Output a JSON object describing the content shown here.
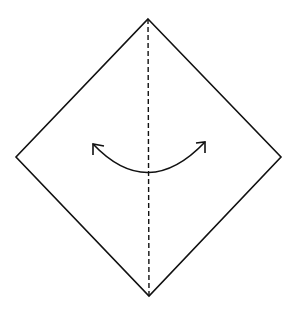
{
  "diagram": {
    "type": "origami-fold-step",
    "colors": {
      "background": "#ffffff",
      "stroke": "#111111"
    },
    "paper": {
      "shape": "diamond",
      "vertices": {
        "top": [
          148,
          19
        ],
        "right": [
          281,
          157
        ],
        "bottom": [
          149,
          296
        ],
        "left": [
          16,
          157
        ]
      }
    },
    "fold_line": {
      "style": "dashed",
      "from": [
        148,
        19
      ],
      "to": [
        149,
        296
      ]
    },
    "arrow": {
      "type": "double-headed-curved",
      "from": [
        92,
        143
      ],
      "via": [
        148,
        173
      ],
      "to": [
        206,
        141
      ]
    }
  }
}
